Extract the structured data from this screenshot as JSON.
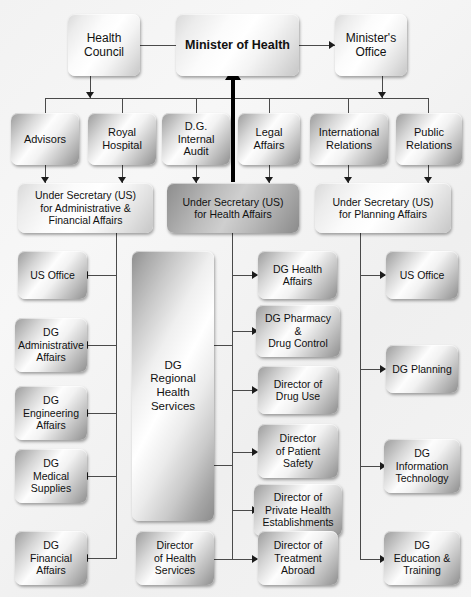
{
  "chart": {
    "type": "org-chart"
  },
  "level1": {
    "health_council": "Health\nCouncil",
    "minister": "Minister of Health",
    "ministers_office": "Minister's\nOffice"
  },
  "level2": [
    {
      "label": "Advisors"
    },
    {
      "label": "Royal\nHospital"
    },
    {
      "label": "D.G.\nInternal\nAudit"
    },
    {
      "label": "Legal\nAffairs"
    },
    {
      "label": "International\nRelations"
    },
    {
      "label": "Public\nRelations"
    }
  ],
  "level3": [
    {
      "label": "Under Secretary (US)\nfor Administrative &\nFinancial Affairs"
    },
    {
      "label": "Under Secretary (US)\nfor Health Affairs"
    },
    {
      "label": "Under Secretary (US)\nfor Planning Affairs"
    }
  ],
  "column_admin": [
    {
      "label": "US Office"
    },
    {
      "label": "DG\nAdministrative\nAffairs"
    },
    {
      "label": "DG\nEngineering\nAffairs"
    },
    {
      "label": "DG\nMedical\nSupplies"
    },
    {
      "label": "DG\nFinancial\nAffairs"
    }
  ],
  "column_regional": [
    {
      "label": "DG\nRegional\nHealth\nServices"
    },
    {
      "label": "Director\nof Health\nServices"
    }
  ],
  "column_health": [
    {
      "label": "DG Health\nAffairs"
    },
    {
      "label": "DG Pharmacy\n&\nDrug Control"
    },
    {
      "label": "Director of\nDrug Use"
    },
    {
      "label": "Director\nof Patient\nSafety"
    },
    {
      "label": "Director of\nPrivate Health\nEstablishments"
    },
    {
      "label": "Director of\nTreatment\nAbroad"
    }
  ],
  "column_planning": [
    {
      "label": "US Office"
    },
    {
      "label": "DG Planning"
    },
    {
      "label": "DG\nInformation\nTechnology"
    },
    {
      "label": "DG\nEducation &\nTraining"
    }
  ],
  "colors": {
    "background": "#f3f3f3",
    "connector": "#4a4a4a",
    "arrow": "#1b1b1b",
    "emphasis_line": "#000000",
    "text": "#111111"
  }
}
